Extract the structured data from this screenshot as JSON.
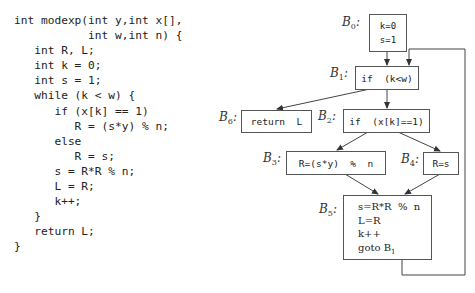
{
  "code": {
    "lines": [
      "int modexp(int y,int x[],",
      "           int w,int n) {",
      "   int R, L;",
      "   int k = 0;",
      "   int s = 1;",
      "   while (k < w) {",
      "      if (x[k] == 1)",
      "         R = (s*y) % n;",
      "      else",
      "         R = s;",
      "      s = R*R % n;",
      "      L = R;",
      "      k++;",
      "   }",
      "   return L;",
      "}"
    ]
  },
  "cfg": {
    "blocks": {
      "B0": {
        "label": "B",
        "sub": "0",
        "lines": [
          "k=0",
          "s=1"
        ]
      },
      "B1": {
        "label": "B",
        "sub": "1",
        "text": "if  (k<w)"
      },
      "B2": {
        "label": "B",
        "sub": "2",
        "text": "if  (x[k]==1)"
      },
      "B3": {
        "label": "B",
        "sub": "3",
        "text": "R=(s*y)  %  n"
      },
      "B4": {
        "label": "B",
        "sub": "4",
        "text": "R=s"
      },
      "B5": {
        "label": "B",
        "sub": "5",
        "lines": [
          "s=R*R  %  n",
          "L=R",
          "k++",
          "goto B"
        ],
        "goto_sub": "1"
      },
      "B6": {
        "label": "B",
        "sub": "6",
        "text": "return  L"
      }
    },
    "edges": [
      [
        "B0",
        "B1"
      ],
      [
        "B1",
        "B2"
      ],
      [
        "B1",
        "B6"
      ],
      [
        "B2",
        "B3"
      ],
      [
        "B2",
        "B4"
      ],
      [
        "B3",
        "B5"
      ],
      [
        "B4",
        "B5"
      ],
      [
        "B5",
        "B1"
      ]
    ],
    "colon": ":"
  }
}
